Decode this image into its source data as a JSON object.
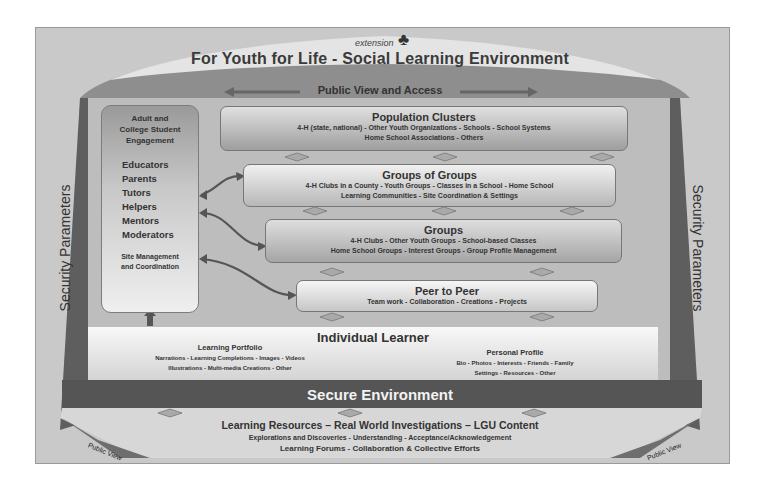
{
  "header": {
    "logo_extension": "extension",
    "logo_4h": "4-H clover",
    "title": "For Youth for Life - Social Learning Environment",
    "public_access": "Public View and Access"
  },
  "side_labels": {
    "left": "Security Parameters",
    "right": "Security Parameters"
  },
  "adult_panel": {
    "heading_lines": [
      "Adult and",
      "College Student",
      "Engagement"
    ],
    "roles": [
      "Educators",
      "Parents",
      "Tutors",
      "Helpers",
      "Mentors",
      "Moderators"
    ],
    "footer_lines": [
      "Site Management",
      "and Coordination"
    ]
  },
  "levels": [
    {
      "title": "Population Clusters",
      "lines": [
        "4-H (state, national)  -  Other Youth Organizations  -  Schools  -  School Systems",
        "Home School Associations  -  Others"
      ]
    },
    {
      "title": "Groups of Groups",
      "lines": [
        "4-H Clubs in a County  -  Youth Groups  -  Classes in a School  -  Home School",
        "Learning Communities  -  Site Coordination & Settings"
      ]
    },
    {
      "title": "Groups",
      "lines": [
        "4-H Clubs  -  Other Youth Groups  -  School-based Classes",
        "Home School Groups  -  Interest Groups  -  Group Profile Management"
      ]
    },
    {
      "title": "Peer to Peer",
      "lines": [
        "Team work  -  Collaboration  -  Creations  -  Projects"
      ]
    }
  ],
  "individual": {
    "title": "Individual Learner",
    "portfolio": {
      "heading": "Learning Portfolio",
      "lines": [
        "Narrations  -  Learning Completions  -  Images  -  Videos",
        "Illustrations  -  Multi-media Creations  -  Other"
      ]
    },
    "profile": {
      "heading": "Personal Profile",
      "lines": [
        "Bio  -  Photos  -  Interests  -  Friends  -  Family",
        "Settings  -  Resources  -  Other"
      ]
    }
  },
  "secure": {
    "label": "Secure Environment"
  },
  "resources": {
    "title": "Learning Resources – Real World Investigations – LGU Content",
    "line1": "Explorations and Discoveries  -  Understanding  -  Acceptance/Acknowledgement",
    "line2": "Learning Forums  -  Collaboration & Collective Efforts"
  },
  "public_view": {
    "left": "Public View",
    "right": "Public View"
  },
  "colors": {
    "frame": "#c9c9c9",
    "dark_band": "#555555",
    "arch": "#8a8a8a",
    "text": "#333333"
  }
}
